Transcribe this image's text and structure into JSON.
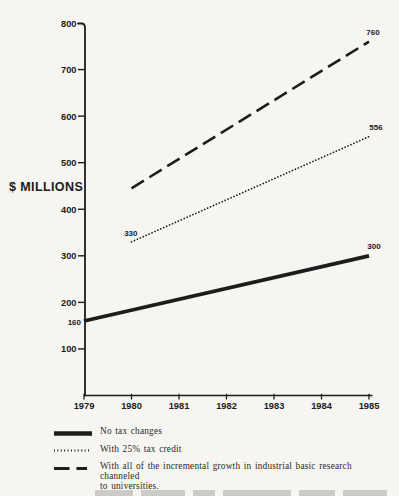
{
  "page": {
    "background_color": "#f6f5f1",
    "ink_color": "#1d1d1d"
  },
  "chart_data": {
    "type": "line",
    "title": "",
    "ylabel": "$ MILLIONS",
    "xlabel": "",
    "xlim": [
      1979,
      1985
    ],
    "ylim": [
      0,
      800
    ],
    "x_ticks": [
      "1979",
      "1980",
      "1981",
      "1982",
      "1983",
      "1984",
      "1985"
    ],
    "y_ticks": [
      800,
      700,
      600,
      500,
      400,
      300,
      200,
      100
    ],
    "grid": false,
    "legend_position": "bottom-left",
    "series": [
      {
        "name": "No tax changes",
        "line_style": "solid",
        "points": [
          {
            "year": 1979,
            "value": 160
          },
          {
            "year": 1985,
            "value": 300
          }
        ],
        "labels": [
          {
            "text": "160",
            "year": 1979,
            "value": 160,
            "anchor": "end",
            "dx": -3,
            "dy": 4
          },
          {
            "text": "300",
            "year": 1985,
            "value": 300,
            "anchor": "middle",
            "dx": 5,
            "dy": -7
          }
        ]
      },
      {
        "name": "With 25% tax credit",
        "line_style": "dotted",
        "points": [
          {
            "year": 1980,
            "value": 330
          },
          {
            "year": 1985,
            "value": 556
          }
        ],
        "labels": [
          {
            "text": "330",
            "year": 1980,
            "value": 330,
            "anchor": "end",
            "dx": 6,
            "dy": -6
          },
          {
            "text": "556",
            "year": 1985,
            "value": 556,
            "anchor": "middle",
            "dx": 7,
            "dy": -7
          }
        ]
      },
      {
        "name": "With all of the incremental growth in industrial basic research channeled to universities.",
        "line_style": "dashed",
        "points": [
          {
            "year": 1980,
            "value": 445
          },
          {
            "year": 1985,
            "value": 760
          }
        ],
        "labels": [
          {
            "text": "760",
            "year": 1985,
            "value": 760,
            "anchor": "middle",
            "dx": 4,
            "dy": -7
          }
        ]
      }
    ]
  },
  "legend": {
    "items": [
      {
        "style": "solid",
        "lines": [
          "No tax changes"
        ]
      },
      {
        "style": "dotted",
        "lines": [
          "With 25% tax credit"
        ]
      },
      {
        "style": "dashed",
        "lines": [
          "With all of the incremental growth in industrial basic research channeled",
          "to universities."
        ]
      }
    ]
  }
}
